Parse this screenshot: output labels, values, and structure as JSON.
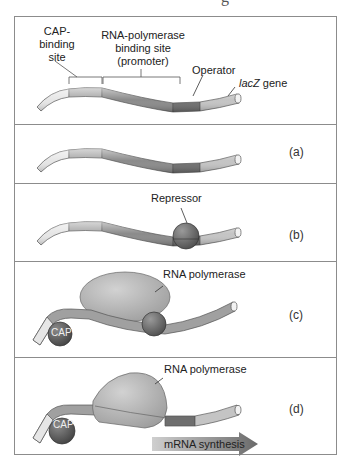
{
  "figure": {
    "clipped_title": "g",
    "panels": [
      {
        "id": "top",
        "labels": {
          "cap_site": "CAP-\nbinding\nsite",
          "cap_site_lines": [
            "CAP-",
            "binding",
            "site"
          ],
          "promoter_lines": [
            "RNA-polymerase",
            "binding site",
            "(promoter)"
          ],
          "operator": "Operator",
          "lacz_italic": "lacZ",
          "lacz_rest": " gene"
        }
      },
      {
        "id": "a",
        "tag": "(a)"
      },
      {
        "id": "b",
        "tag": "(b)",
        "labels": {
          "repressor": "Repressor"
        }
      },
      {
        "id": "c",
        "tag": "(c)",
        "labels": {
          "polymerase": "RNA polymerase",
          "cap": "CAP"
        }
      },
      {
        "id": "d",
        "tag": "(d)",
        "labels": {
          "polymerase": "RNA polymerase",
          "cap": "CAP",
          "arrow": "mRNA synthesis"
        }
      }
    ],
    "colors": {
      "frame": "#8c8c8c",
      "dna_light": "#e6e6e6",
      "dna_mid": "#a6a6a6",
      "dna_dark": "#8a8a8a",
      "operator": "#6e6e6e",
      "lacz": "#c4c4c4",
      "repressor": "#6a6a6a",
      "polymerase": "#b8b8b8",
      "cap": "#5e5e5e",
      "arrow_start": "#cfcfcf",
      "arrow_end": "#6a6a6a"
    }
  }
}
